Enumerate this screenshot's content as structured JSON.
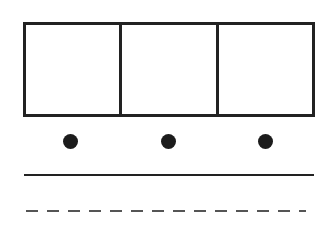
{
  "diagram": {
    "boxes": [
      {
        "id": "box-1",
        "label": ""
      },
      {
        "id": "box-2",
        "label": ""
      },
      {
        "id": "box-3",
        "label": ""
      }
    ],
    "dots": [
      {
        "id": "dot-1",
        "cx": 71,
        "cy": 142
      },
      {
        "id": "dot-2",
        "cx": 169,
        "cy": 142
      },
      {
        "id": "dot-3",
        "cx": 266,
        "cy": 142
      }
    ],
    "lines": [
      {
        "id": "solid-line",
        "style": "solid",
        "y": 175
      },
      {
        "id": "dashed-line",
        "style": "dashed",
        "y": 211
      }
    ],
    "colors": {
      "stroke": "#222222",
      "dot": "#1c1c1c",
      "dash": "#555555",
      "background": "#ffffff"
    }
  }
}
